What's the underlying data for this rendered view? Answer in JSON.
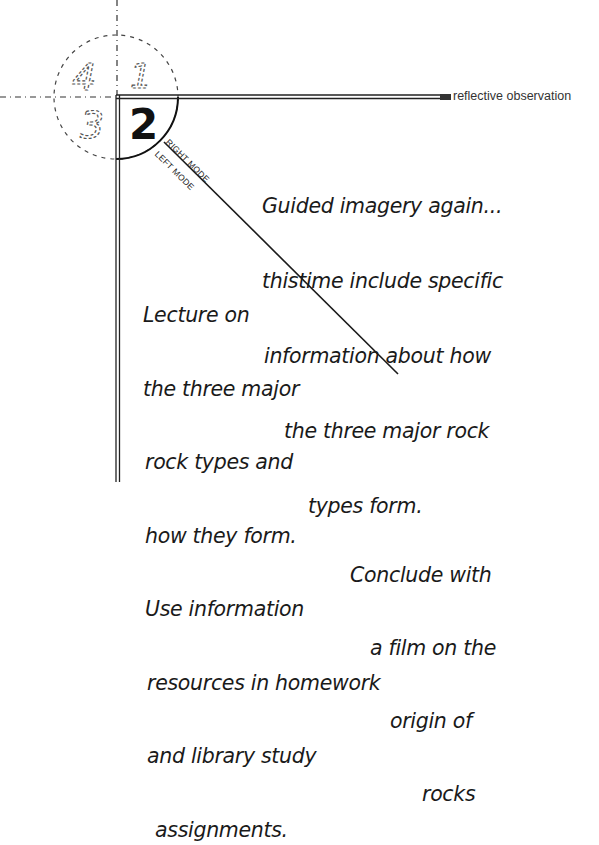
{
  "quadrants": {
    "q1": "1",
    "q2": "2",
    "q3": "3",
    "q4": "4",
    "active": "2"
  },
  "axis": {
    "horizontal_label": "reflective observation"
  },
  "modes": {
    "right": "RIGHT MODE",
    "left": "LEFT MODE"
  },
  "notes": {
    "right_mode": [
      "Guided imagery again...",
      "thistime include specific",
      "information about how",
      "the three major rock",
      "types form.",
      "Conclude with",
      "a film on the",
      "origin of",
      "rocks"
    ],
    "left_mode": [
      "Lecture on",
      "the three major",
      "rock types and",
      "how they form.",
      "Use information",
      "resources in homework",
      "and library study",
      "assignments."
    ]
  },
  "colors": {
    "ink": "#1a1a1a",
    "paper": "#ffffff"
  }
}
